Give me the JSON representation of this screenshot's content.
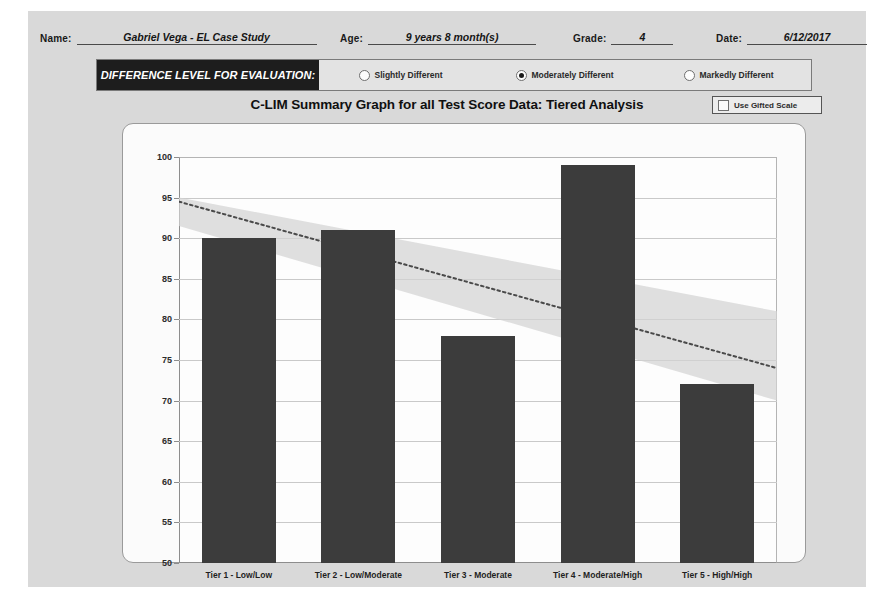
{
  "form": {
    "name": {
      "label": "Name:",
      "value": "Gabriel Vega - EL Case Study"
    },
    "age": {
      "label": "Age:",
      "value": "9 years 8 month(s)"
    },
    "grade": {
      "label": "Grade:",
      "value": "4"
    },
    "date": {
      "label": "Date:",
      "value": "6/12/2017"
    }
  },
  "difference_level": {
    "title": "DIFFERENCE LEVEL FOR EVALUATION:",
    "options": [
      {
        "label": "Slightly Different",
        "selected": false
      },
      {
        "label": "Moderately Different",
        "selected": true
      },
      {
        "label": "Markedly Different",
        "selected": false
      }
    ]
  },
  "gifted_scale": {
    "label": "Use Gifted Scale",
    "checked": false
  },
  "colors": {
    "bar": "#3c3c3c",
    "band": "#d2d2d2",
    "trend": "#4a4a4a",
    "panel": "#fbfbfb",
    "page": "#d9d9d9",
    "title_bar": "#1d1d1d"
  },
  "chart_data": {
    "type": "bar",
    "title": "C-LIM Summary Graph for all Test Score Data: Tiered Analysis",
    "xlabel": "",
    "ylabel": "",
    "ylim": [
      50,
      100
    ],
    "ytick_step": 5,
    "yticks": [
      50,
      55,
      60,
      65,
      70,
      75,
      80,
      85,
      90,
      95,
      100
    ],
    "grid": true,
    "legend": "none",
    "categories": [
      "Tier 1 - Low/Low",
      "Tier 2 - Low/Moderate",
      "Tier 3 - Moderate",
      "Tier 4 - Moderate/High",
      "Tier 5 - High/High"
    ],
    "values": [
      90,
      91,
      78,
      99,
      72
    ],
    "annotations": {
      "expected_band": {
        "description": "Shaded expected-performance band declining left to right",
        "left_upper": 95,
        "left_lower": 91.5,
        "right_upper": 81,
        "right_lower": 70
      },
      "trend_line": {
        "description": "Dotted declining expected-score trend line",
        "style": "dotted",
        "left_value": 94.5,
        "right_value": 74
      }
    }
  }
}
